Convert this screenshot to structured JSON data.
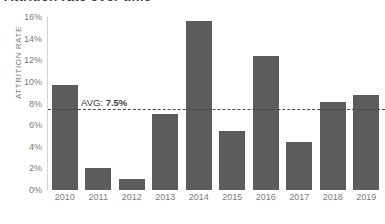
{
  "chart_data": {
    "type": "bar",
    "title": "Attrition rate over time",
    "xlabel": "",
    "ylabel": "ATTRITION RATE",
    "categories": [
      "2010",
      "2011",
      "2012",
      "2013",
      "2014",
      "2015",
      "2016",
      "2017",
      "2018",
      "2019"
    ],
    "values": [
      9.7,
      2.0,
      1.0,
      7.0,
      15.6,
      5.5,
      12.4,
      4.4,
      8.1,
      8.8
    ],
    "ylim": [
      0,
      16
    ],
    "y_ticks": [
      "0%",
      "2%",
      "4%",
      "6%",
      "8%",
      "10%",
      "12%",
      "14%",
      "16%"
    ],
    "y_tick_values": [
      0,
      2,
      4,
      6,
      8,
      10,
      12,
      14,
      16
    ],
    "grid": false,
    "legend": "none",
    "series_color": "#5c5c5c",
    "annotations": [
      {
        "name": "average-line",
        "label_prefix": "AVG: ",
        "label_value": "7.5%",
        "value": 7.5,
        "style": "dashed",
        "color": "#4a4a4a"
      }
    ]
  }
}
